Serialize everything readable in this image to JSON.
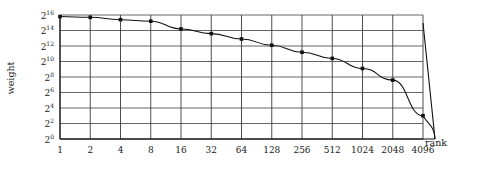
{
  "chart_data": {
    "type": "line",
    "title": "",
    "xlabel": "rank",
    "ylabel": "weight",
    "xscale": "log2",
    "yscale": "log2",
    "grid": true,
    "legend": null,
    "x": [
      1,
      2,
      4,
      8,
      16,
      32,
      64,
      128,
      256,
      512,
      1024,
      2048,
      4096
    ],
    "xtick_labels": [
      "1",
      "2",
      "4",
      "8",
      "16",
      "32",
      "64",
      "128",
      "256",
      "512",
      "1024",
      "2048",
      "4096"
    ],
    "ytick_labels": [
      "2^16",
      "2^14",
      "2^12",
      "2^10",
      "2^8",
      "2^6",
      "2^4",
      "2^2",
      "2^0"
    ],
    "ytick_bases": [
      "2",
      "2",
      "2",
      "2",
      "2",
      "2",
      "2",
      "2",
      "2"
    ],
    "ytick_exponents": [
      "16",
      "14",
      "12",
      "10",
      "8",
      "6",
      "4",
      "2",
      "0"
    ],
    "ytick_exponent_values": [
      16,
      14,
      12,
      10,
      8,
      6,
      4,
      2,
      0
    ],
    "ylim_exponent": [
      0,
      16
    ],
    "values_log2": [
      15.8,
      15.7,
      15.4,
      15.2,
      14.2,
      13.6,
      12.9,
      12.1,
      11.2,
      10.4,
      9.1,
      7.6,
      3.0
    ],
    "values": [
      57052,
      53226,
      43238,
      37641,
      18820,
      12417,
      7643,
      4391,
      2352,
      1351,
      549,
      194,
      8
    ],
    "marker": "filled-circle",
    "annotations": []
  },
  "axis": {
    "x_title": "rank",
    "y_title": "weight"
  }
}
